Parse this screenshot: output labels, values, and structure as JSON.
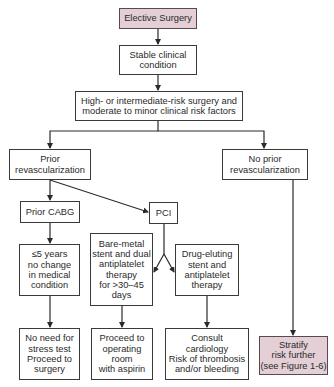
{
  "diagram": {
    "type": "flowchart",
    "colors": {
      "highlight_fill": "#e3cfd5",
      "border": "#3a3a3a",
      "line": "#2a2a2a"
    },
    "nodes": {
      "elective": {
        "label": "Elective Surgery"
      },
      "stable": {
        "label": "Stable clinical\ncondition"
      },
      "risk": {
        "label": "High- or intermediate-risk surgery and\nmoderate to minor clinical risk factors"
      },
      "prior_revasc": {
        "label": "Prior\nrevascularization"
      },
      "no_prior_revasc": {
        "label": "No prior\nrevascularization"
      },
      "prior_cabg": {
        "label": "Prior CABG"
      },
      "pci": {
        "label": "PCI"
      },
      "five_years": {
        "label": "≤5 years\nno change\nin medical\ncondition"
      },
      "bare_metal": {
        "label": "Bare-metal\nstent and dual\nantiplatelet\ntherapy\nfor >30–45\ndays"
      },
      "drug_eluting": {
        "label": "Drug-eluting\nstent and\nantiplatelet\ntherapy"
      },
      "no_need": {
        "label": "No need for\nstress test\nProceed to\nsurgery"
      },
      "proceed": {
        "label": "Proceed to\noperating\nroom\nwith aspirin"
      },
      "consult": {
        "label": "Consult\ncardiology\nRisk of thrombosis\nand/or bleeding"
      },
      "stratify": {
        "label": "Stratify\nrisk further\n(see Figure 1-6)"
      }
    },
    "edges": [
      [
        "elective",
        "stable"
      ],
      [
        "stable",
        "risk"
      ],
      [
        "risk",
        "prior_revasc"
      ],
      [
        "risk",
        "no_prior_revasc"
      ],
      [
        "prior_revasc",
        "prior_cabg"
      ],
      [
        "prior_revasc",
        "pci"
      ],
      [
        "prior_cabg",
        "five_years"
      ],
      [
        "pci",
        "bare_metal"
      ],
      [
        "pci",
        "drug_eluting"
      ],
      [
        "five_years",
        "no_need"
      ],
      [
        "bare_metal",
        "proceed"
      ],
      [
        "drug_eluting",
        "consult"
      ],
      [
        "no_prior_revasc",
        "stratify"
      ]
    ]
  }
}
